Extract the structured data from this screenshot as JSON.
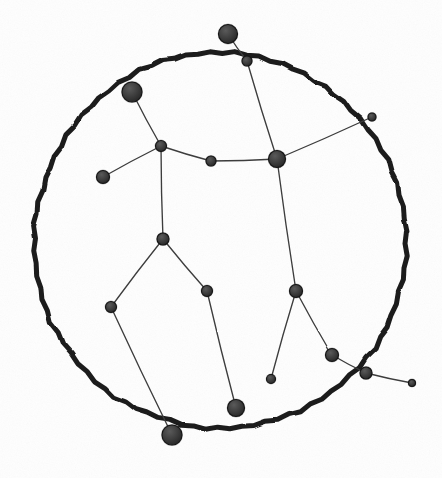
{
  "figure": {
    "background_color": "#fefefe",
    "ink_color": "#1c1c1c",
    "node_fill_color": "#3b3b3b",
    "node_stroke_color": "#141414",
    "edge_color": "#3d3d3d",
    "width": 442,
    "height": 478
  },
  "boundary_circle": {
    "name": "sky-horizon-circle",
    "cx": 220,
    "cy": 241,
    "rx": 186,
    "ry": 188,
    "stroke_width": 5,
    "rotation_deg": -3
  },
  "chart_data": {
    "type": "scatter",
    "xlabel": "",
    "ylabel": "",
    "xlim": [
      0,
      442
    ],
    "ylim": [
      0,
      478
    ],
    "grid": false,
    "legend": "none",
    "nodes": [
      {
        "id": "n0",
        "name": "star-top-bright",
        "x": 228,
        "y": 34,
        "r": 9.5
      },
      {
        "id": "n1",
        "name": "star-top-small",
        "x": 247,
        "y": 61,
        "r": 5.0
      },
      {
        "id": "n2",
        "name": "star-shoulder-left",
        "x": 132,
        "y": 92,
        "r": 10.0
      },
      {
        "id": "n3",
        "name": "star-junction-upper",
        "x": 161,
        "y": 146,
        "r": 5.5
      },
      {
        "id": "n4",
        "name": "star-arm-left",
        "x": 103,
        "y": 177,
        "r": 6.5
      },
      {
        "id": "n5",
        "name": "star-belt-mid",
        "x": 211,
        "y": 161,
        "r": 5.0
      },
      {
        "id": "n6",
        "name": "star-shoulder-right",
        "x": 277,
        "y": 159,
        "r": 8.5
      },
      {
        "id": "n7",
        "name": "star-edge-right-upper",
        "x": 372,
        "y": 117,
        "r": 4.0
      },
      {
        "id": "n8",
        "name": "star-torso-center",
        "x": 163,
        "y": 239,
        "r": 6.0
      },
      {
        "id": "n9",
        "name": "star-hip-left",
        "x": 111,
        "y": 307,
        "r": 5.5
      },
      {
        "id": "n10",
        "name": "star-hip-right",
        "x": 207,
        "y": 291,
        "r": 5.5
      },
      {
        "id": "n11",
        "name": "star-foot-left",
        "x": 172,
        "y": 435,
        "r": 10.0
      },
      {
        "id": "n12",
        "name": "star-foot-center",
        "x": 236,
        "y": 408,
        "r": 8.5
      },
      {
        "id": "n13",
        "name": "star-knee-right",
        "x": 296,
        "y": 291,
        "r": 6.5
      },
      {
        "id": "n14",
        "name": "star-foot-right-small",
        "x": 271,
        "y": 379,
        "r": 4.5
      },
      {
        "id": "n15",
        "name": "star-ankle-right",
        "x": 332,
        "y": 355,
        "r": 6.5
      },
      {
        "id": "n16",
        "name": "star-edge-right-lower",
        "x": 366,
        "y": 373,
        "r": 6.0
      },
      {
        "id": "n17",
        "name": "star-tail-right",
        "x": 412,
        "y": 383,
        "r": 3.5
      }
    ],
    "edges": [
      {
        "name": "edge-top-bright-to-top-small",
        "from": "n0",
        "to": "n1"
      },
      {
        "name": "edge-top-small-to-shoulder-right",
        "from": "n1",
        "to": "n6"
      },
      {
        "name": "edge-shoulder-left-to-junction",
        "from": "n2",
        "to": "n3"
      },
      {
        "name": "edge-junction-to-arm-left",
        "from": "n3",
        "to": "n4"
      },
      {
        "name": "edge-junction-to-belt-mid",
        "from": "n3",
        "to": "n5"
      },
      {
        "name": "edge-belt-mid-to-shoulder-right",
        "from": "n5",
        "to": "n6"
      },
      {
        "name": "edge-shoulder-right-to-edge-up",
        "from": "n6",
        "to": "n7"
      },
      {
        "name": "edge-junction-to-torso",
        "from": "n3",
        "to": "n8"
      },
      {
        "name": "edge-torso-to-hip-left",
        "from": "n8",
        "to": "n9"
      },
      {
        "name": "edge-torso-to-hip-right",
        "from": "n8",
        "to": "n10"
      },
      {
        "name": "edge-hip-left-to-foot-left",
        "from": "n9",
        "to": "n11"
      },
      {
        "name": "edge-hip-right-to-foot-center",
        "from": "n10",
        "to": "n12"
      },
      {
        "name": "edge-shoulder-right-to-knee",
        "from": "n6",
        "to": "n13"
      },
      {
        "name": "edge-knee-to-foot-right-small",
        "from": "n13",
        "to": "n14"
      },
      {
        "name": "edge-knee-to-ankle-right",
        "from": "n13",
        "to": "n15"
      },
      {
        "name": "edge-ankle-to-edge-right-lower",
        "from": "n15",
        "to": "n16"
      },
      {
        "name": "edge-edge-right-lower-to-tail",
        "from": "n16",
        "to": "n17"
      }
    ]
  }
}
